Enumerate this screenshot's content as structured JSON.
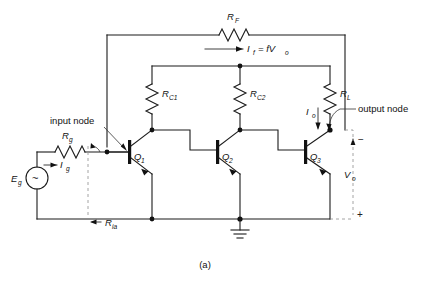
{
  "figure": {
    "caption": "(a)"
  },
  "labels": {
    "feedback_resistor": "R",
    "feedback_resistor_sub": "F",
    "feedback_current": "I",
    "feedback_current_sub": "f",
    "feedback_current_expr": "= fV",
    "feedback_current_expr_sub": "o",
    "rc1": "R",
    "rc1_sub": "C1",
    "rc2": "R",
    "rc2_sub": "C2",
    "rl": "R",
    "rl_sub": "L",
    "rg": "R",
    "rg_sub": "g",
    "ig": "I",
    "ig_sub": "g",
    "eg": "E",
    "eg_sub": "g",
    "source_symbol": "~",
    "io": "I",
    "io_sub": "o",
    "vo": "V",
    "vo_sub": "o",
    "ria": "R",
    "ria_sub": "ia",
    "q1": "Q",
    "q1_sub": "1",
    "q2": "Q",
    "q2_sub": "2",
    "q3": "Q",
    "q3_sub": "3",
    "input_node": "input node",
    "output_node": "output node",
    "polarity_minus": "−",
    "polarity_plus": "+"
  },
  "colors": {
    "wire": "#1a1a1a",
    "dashed": "#9a9a9a",
    "background": "#ffffff",
    "text": "#111111"
  }
}
